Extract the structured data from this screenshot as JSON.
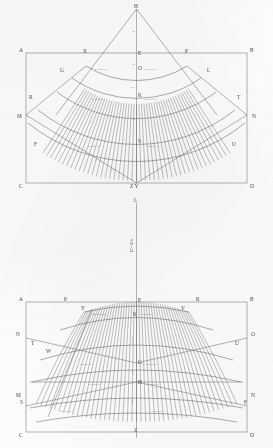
{
  "plate": {
    "title": "Geometric development plate",
    "background_color": "#fdfdfc",
    "ink_color": "#4a4a4a",
    "line_color": "#5a5a5a"
  },
  "figures": [
    {
      "id": "upper",
      "name": "conical-sector-development",
      "apex_label": "H",
      "frame_corners": {
        "top_left": "A",
        "top_right": "B",
        "bottom_left": "C",
        "bottom_right": "D"
      },
      "side_labels": {
        "left": "M",
        "right": "N"
      },
      "arc_labels": {
        "top_left": "X",
        "top_right": "P",
        "second_left": "G",
        "second_right": "L",
        "third_left": "R",
        "third_right": "T",
        "fourth_left": "F",
        "fourth_right": "U"
      },
      "centerline_labels": [
        "H",
        "E",
        "O",
        "K",
        "S",
        "Z Y"
      ],
      "centerline_small": [
        "14",
        "18",
        "ST",
        "34"
      ],
      "arc_text_left": "8 7 6 5 4 3 2 1",
      "arc_text_right": "1 2 3 4 5 6 7 8",
      "bottom_center_label": "Z Y"
    },
    {
      "id": "lower",
      "name": "barrel-projection-development",
      "top_label": "L",
      "vertical_dimension_text": "LT = 18 ft",
      "frame_corners": {
        "top_left": "A",
        "top_right": "B",
        "bottom_left": "C",
        "bottom_right": "D"
      },
      "top_arc_labels": {
        "left_outer": "P",
        "left_inner": "Y",
        "right_inner": "V",
        "right_outer": "R"
      },
      "side_labels": {
        "left_upper": "N",
        "right_upper": "O",
        "left_lower": "M",
        "right_lower": "N"
      },
      "inner_labels": {
        "left_t": "T",
        "left_w": "W",
        "left_s": "S",
        "right_u": "U",
        "right_f": "F"
      },
      "centerline_labels": [
        "E",
        "K",
        "G",
        "H",
        "Z"
      ],
      "annotation_parallel": "Parallel Theile",
      "annotation_k": "K von Theile",
      "centerline_small": [
        "NZ = 0",
        "NZ",
        "Nfdl"
      ],
      "arc_text_left": "8 7 6 5 4 3 2 1",
      "arc_text_right": "1 2 3 4 5 6 7 8",
      "bottom_center_label": "Z"
    }
  ]
}
